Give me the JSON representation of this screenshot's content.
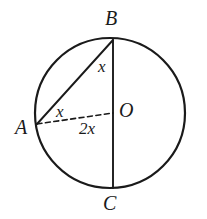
{
  "figure": {
    "kind": "circle-geometry-diagram",
    "background_color": "#ffffff",
    "stroke_color": "#1a1a1a",
    "canvas": {
      "width": 207,
      "height": 219
    }
  },
  "circle": {
    "center_x": 110,
    "center_y": 113,
    "radius": 75,
    "stroke_width": 2.2,
    "style": "solid"
  },
  "points": {
    "A": {
      "label": "A",
      "x": 37,
      "y": 124,
      "position": "left of circle"
    },
    "B": {
      "label": "B",
      "x": 113,
      "y": 40,
      "position": "top of circle"
    },
    "C": {
      "label": "C",
      "x": 113,
      "y": 188,
      "position": "bottom of circle"
    },
    "O": {
      "label": "O",
      "x": 113,
      "y": 113,
      "position": "center"
    }
  },
  "segments": [
    {
      "name": "chord-AB",
      "from": "A",
      "to": "B",
      "style": "solid",
      "stroke_width": 1.9
    },
    {
      "name": "diameter-BC",
      "from": "B",
      "to": "C",
      "style": "solid",
      "stroke_width": 1.9
    },
    {
      "name": "radius-AO",
      "from": "A",
      "to": "O",
      "style": "dashed",
      "stroke_width": 1.6,
      "dash_pattern": "5,3.5"
    }
  ],
  "angle_labels": {
    "at_B": "x",
    "at_A": "x",
    "at_O": "2x"
  }
}
